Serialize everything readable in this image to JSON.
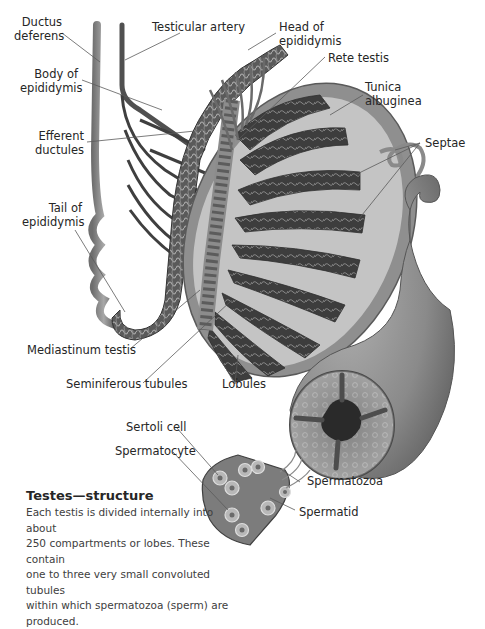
{
  "diagram": {
    "title": "Testes—structure",
    "description": "Each testis is divided internally into about 250 compartments or lobes. These contain one to three very small convoluted tubules within which spermatozoa (sperm) are produced.",
    "description_lines": [
      "Each testis is divided internally into about",
      "250 compartments or lobes. These contain",
      "one to three very small convoluted tubules",
      "within which spermatozoa (sperm) are produced."
    ],
    "labels": {
      "ductus_deferens": [
        "Ductus",
        "deferens"
      ],
      "testicular_artery": "Testicular artery",
      "head_of_epididymis": [
        "Head of",
        "epididymis"
      ],
      "rete_testis": "Rete testis",
      "body_of_epididymis": [
        "Body of",
        "epididymis"
      ],
      "tunica_albuginea": [
        "Tunica",
        "albuginea"
      ],
      "efferent_ductules": [
        "Efferent",
        "ductules"
      ],
      "septae": "Septae",
      "tail_of_epididymis": [
        "Tail of",
        "epididymis"
      ],
      "mediastinum_testis": "Mediastinum testis",
      "seminiferous_tubules": "Seminiferous tubules",
      "lobules": "Lobules",
      "sertoli_cell": "Sertoli cell",
      "spermatocyte": "Spermatocyte",
      "spermatozoa": "Spermatozoa",
      "spermatid": "Spermatid"
    },
    "colors": {
      "tissue_dark": "#3a3a3a",
      "tissue_mid": "#7a7a7a",
      "tissue_light": "#b5b5b5",
      "tunica": "#9c9c9c",
      "leader_line": "#555555",
      "background": "#ffffff"
    }
  }
}
